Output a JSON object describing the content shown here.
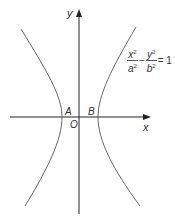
{
  "diagram": {
    "type": "hyperbola",
    "axes": {
      "x_label": "x",
      "y_label": "y",
      "origin_label": "O"
    },
    "vertices": [
      {
        "label": "A"
      },
      {
        "label": "B"
      }
    ],
    "equation": {
      "term1_num": "x",
      "term1_num_exp": "2",
      "term1_den": "a",
      "term1_den_exp": "2",
      "operator": "−",
      "term2_num": "y",
      "term2_num_exp": "2",
      "term2_den": "b",
      "term2_den_exp": "2",
      "equals": "= 1"
    },
    "colors": {
      "axis": "#222222",
      "curve": "#555555",
      "text": "#333333"
    }
  }
}
